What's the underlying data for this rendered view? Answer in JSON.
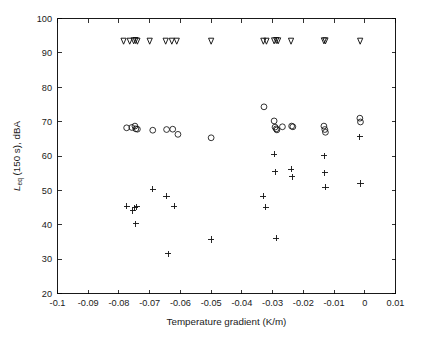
{
  "figure": {
    "background_color": "#ffffff",
    "marker_color": "#111111",
    "axis_color": "#000000"
  },
  "axes": {
    "x_title": "Temperature gradient (K/m)",
    "y_title_main": "L",
    "y_title_sub": "eq",
    "y_title_rest": " (150 s), dBA",
    "x_tick_labels": [
      "-0.1",
      "-0.09",
      "-0.08",
      "-0.07",
      "-0.06",
      "-0.05",
      "-0.04",
      "-0.03",
      "-0.02",
      "-0.01",
      "0",
      "0.01"
    ],
    "y_tick_labels": [
      "20",
      "30",
      "40",
      "50",
      "60",
      "70",
      "80",
      "90",
      "100"
    ]
  },
  "chart_data": {
    "type": "scatter",
    "title": "",
    "xlabel": "Temperature gradient (K/m)",
    "ylabel": "Leq (150 s), dBA",
    "xlim": [
      -0.1,
      0.01
    ],
    "ylim": [
      20,
      100
    ],
    "xticks": [
      -0.1,
      -0.09,
      -0.08,
      -0.07,
      -0.06,
      -0.05,
      -0.04,
      -0.03,
      -0.02,
      -0.01,
      0,
      0.01
    ],
    "yticks": [
      20,
      30,
      40,
      50,
      60,
      70,
      80,
      90,
      100
    ],
    "grid": false,
    "legend": "none",
    "series": [
      {
        "name": "source-level-marker",
        "marker": "v",
        "values": [
          [
            -0.0785,
            93.4
          ],
          [
            -0.0765,
            93.4
          ],
          [
            -0.0752,
            93.5
          ],
          [
            -0.0746,
            93.6
          ],
          [
            -0.074,
            93.4
          ],
          [
            -0.07,
            93.4
          ],
          [
            -0.0648,
            93.4
          ],
          [
            -0.0628,
            93.4
          ],
          [
            -0.0612,
            93.4
          ],
          [
            -0.05,
            93.4
          ],
          [
            -0.033,
            93.4
          ],
          [
            -0.032,
            93.4
          ],
          [
            -0.0295,
            93.5
          ],
          [
            -0.0288,
            93.6
          ],
          [
            -0.0282,
            93.5
          ],
          [
            -0.024,
            93.4
          ],
          [
            -0.0133,
            93.5
          ],
          [
            -0.0128,
            93.5
          ],
          [
            -0.0015,
            93.4
          ]
        ]
      },
      {
        "name": "measured-leq-circles",
        "marker": "o",
        "values": [
          [
            -0.0775,
            68.2
          ],
          [
            -0.0758,
            68.3
          ],
          [
            -0.0748,
            68.7
          ],
          [
            -0.0745,
            67.9
          ],
          [
            -0.074,
            67.8
          ],
          [
            -0.069,
            67.5
          ],
          [
            -0.0645,
            67.7
          ],
          [
            -0.0625,
            67.8
          ],
          [
            -0.0608,
            66.3
          ],
          [
            -0.05,
            65.3
          ],
          [
            -0.0328,
            74.3
          ],
          [
            -0.0295,
            70.2
          ],
          [
            -0.0292,
            68.4
          ],
          [
            -0.0288,
            67.9
          ],
          [
            -0.0286,
            67.6
          ],
          [
            -0.0268,
            68.5
          ],
          [
            -0.0238,
            68.7
          ],
          [
            -0.0234,
            68.5
          ],
          [
            -0.0133,
            68.7
          ],
          [
            -0.013,
            67.7
          ],
          [
            -0.0128,
            66.9
          ],
          [
            -0.0016,
            71.0
          ],
          [
            -0.0014,
            69.9
          ]
        ]
      },
      {
        "name": "background-leq-plus",
        "marker": "+",
        "values": [
          [
            -0.0775,
            45.4
          ],
          [
            -0.0755,
            44.1
          ],
          [
            -0.0748,
            44.9
          ],
          [
            -0.0742,
            45.2
          ],
          [
            -0.0745,
            40.3
          ],
          [
            -0.069,
            50.3
          ],
          [
            -0.0645,
            48.3
          ],
          [
            -0.062,
            45.4
          ],
          [
            -0.064,
            31.6
          ],
          [
            -0.05,
            35.7
          ],
          [
            -0.033,
            48.3
          ],
          [
            -0.0322,
            45.1
          ],
          [
            -0.0295,
            60.5
          ],
          [
            -0.0292,
            55.4
          ],
          [
            -0.0288,
            36.1
          ],
          [
            -0.024,
            56.2
          ],
          [
            -0.0236,
            54.0
          ],
          [
            -0.0132,
            60.1
          ],
          [
            -0.013,
            55.1
          ],
          [
            -0.0128,
            50.9
          ],
          [
            -0.0016,
            65.6
          ],
          [
            -0.0014,
            52.0
          ]
        ]
      }
    ]
  }
}
